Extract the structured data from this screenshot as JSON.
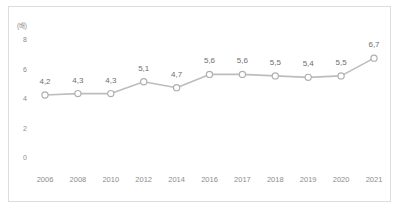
{
  "chart_data": {
    "type": "line",
    "title": "",
    "xlabel": "",
    "ylabel": "",
    "unit_label": "(배)",
    "categories": [
      "2006",
      "2008",
      "2010",
      "2012",
      "2014",
      "2016",
      "2017",
      "2018",
      "2019",
      "2020",
      "2021"
    ],
    "values": [
      4.2,
      4.3,
      4.3,
      5.1,
      4.7,
      5.6,
      5.6,
      5.5,
      5.4,
      5.5,
      6.7
    ],
    "point_labels": [
      "4,2",
      "4,3",
      "4,3",
      "5,1",
      "4,7",
      "5,6",
      "5,6",
      "5,5",
      "5,4",
      "5,5",
      "6,7"
    ],
    "ylim": [
      0,
      8
    ],
    "yticks": [
      0,
      2,
      4,
      6,
      8
    ],
    "ytick_labels": [
      "0",
      "2",
      "4",
      "6",
      "8"
    ],
    "grid": false,
    "legend": false,
    "series": [
      {
        "name": "",
        "values": [
          4.2,
          4.3,
          4.3,
          5.1,
          4.7,
          5.6,
          5.6,
          5.5,
          5.4,
          5.5,
          6.7
        ]
      }
    ],
    "colors": {
      "line": "#bdbdbd",
      "marker_fill": "#ffffff",
      "marker_stroke": "#b0b0b0",
      "text": "#8c8c8c",
      "label_text": "#6e6e6e",
      "border": "#dcdcdc",
      "background": "#ffffff"
    }
  }
}
